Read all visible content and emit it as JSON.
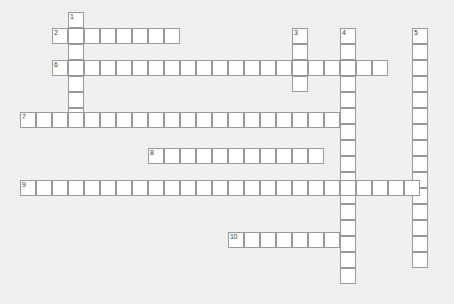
{
  "page": {
    "title": "Crossword Puzzle Grid",
    "background_color": "#f0efef",
    "cell_fill_color": "#ffffff",
    "cell_border_color": "#9a9a9a",
    "number_color": "#3a3a3a",
    "canvas_width": 454,
    "canvas_height": 304,
    "cell_size": 16
  },
  "grid": {
    "origin_x": 4,
    "origin_y": 12,
    "columns": 28,
    "rows": 18
  },
  "entries": [
    {
      "number": "1",
      "direction": "down",
      "x": 68,
      "y": 12,
      "length": 7,
      "cells": [
        "",
        "",
        "",
        "",
        "",
        "",
        ""
      ]
    },
    {
      "number": "2",
      "direction": "across",
      "x": 52,
      "y": 28,
      "length": 8,
      "cells": [
        "",
        "",
        "",
        "",
        "",
        "",
        "",
        ""
      ]
    },
    {
      "number": "3",
      "direction": "down",
      "x": 292,
      "y": 28,
      "length": 4,
      "cells": [
        "",
        "",
        "",
        ""
      ]
    },
    {
      "number": "4",
      "direction": "down",
      "x": 340,
      "y": 28,
      "length": 16,
      "cells": [
        "",
        "",
        "",
        "",
        "",
        "",
        "",
        "",
        "",
        "",
        "",
        "",
        "",
        "",
        "",
        ""
      ]
    },
    {
      "number": "5",
      "direction": "down",
      "x": 412,
      "y": 28,
      "length": 15,
      "cells": [
        "",
        "",
        "",
        "",
        "",
        "",
        "",
        "",
        "",
        "",
        "",
        "",
        "",
        "",
        ""
      ]
    },
    {
      "number": "6",
      "direction": "across",
      "x": 52,
      "y": 60,
      "length": 21,
      "cells": [
        "",
        "",
        "",
        "",
        "",
        "",
        "",
        "",
        "",
        "",
        "",
        "",
        "",
        "",
        "",
        "",
        "",
        "",
        "",
        "",
        ""
      ]
    },
    {
      "number": "7",
      "direction": "across",
      "x": 20,
      "y": 112,
      "length": 20,
      "cells": [
        "",
        "",
        "",
        "",
        "",
        "",
        "",
        "",
        "",
        "",
        "",
        "",
        "",
        "",
        "",
        "",
        "",
        "",
        "",
        ""
      ]
    },
    {
      "number": "8",
      "direction": "across",
      "x": 148,
      "y": 148,
      "length": 11,
      "cells": [
        "",
        "",
        "",
        "",
        "",
        "",
        "",
        "",
        "",
        "",
        ""
      ]
    },
    {
      "number": "9",
      "direction": "across",
      "x": 20,
      "y": 180,
      "length": 25,
      "cells": [
        "",
        "",
        "",
        "",
        "",
        "",
        "",
        "",
        "",
        "",
        "",
        "",
        "",
        "",
        "",
        "",
        "",
        "",
        "",
        "",
        "",
        "",
        "",
        "",
        ""
      ]
    },
    {
      "number": "10",
      "direction": "across",
      "x": 228,
      "y": 232,
      "length": 7,
      "cells": [
        "",
        "",
        "",
        "",
        "",
        "",
        ""
      ]
    }
  ]
}
